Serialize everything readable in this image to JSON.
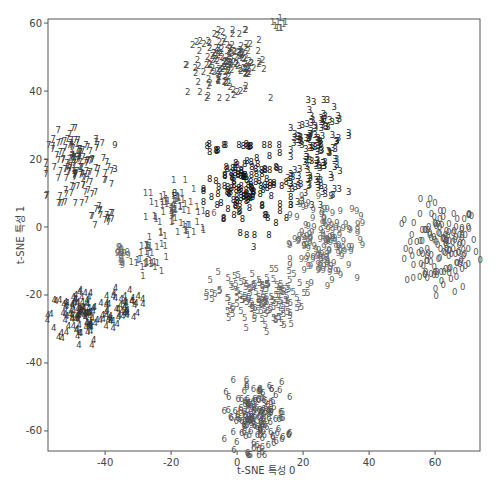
{
  "chart_data": {
    "type": "scatter",
    "title": "",
    "xlabel": "t-SNE 특성 0",
    "ylabel": "t-SNE 특성 1",
    "xlim": [
      -57.3,
      73.6
    ],
    "ylim": [
      -65.9,
      61.2
    ],
    "xticks": [
      -40,
      -20,
      0,
      20,
      40,
      60
    ],
    "yticks": [
      -60,
      -40,
      -20,
      0,
      20,
      40,
      60
    ],
    "grid": false,
    "legend": "none (points drawn as digit glyphs 0-9)",
    "marker": "text glyph of class label",
    "clusters": [
      {
        "label": "0",
        "color": "#555555",
        "n": 150,
        "groups": [
          {
            "cx": 62,
            "cy": -6,
            "sx": 5.5,
            "sy": 6.5
          }
        ]
      },
      {
        "label": "1",
        "color": "#5a5a5a",
        "n": 110,
        "groups": [
          {
            "cx": -19,
            "cy": 6,
            "sx": 4,
            "sy": 3.5,
            "w": 0.55
          },
          {
            "cx": -27,
            "cy": -8,
            "sx": 2.5,
            "sy": 3,
            "w": 0.3
          },
          {
            "cx": 13,
            "cy": 60,
            "sx": 1,
            "sy": 1.5,
            "w": 0.08
          },
          {
            "cx": -14,
            "cy": -1,
            "sx": 2,
            "sy": 1,
            "w": 0.07
          }
        ]
      },
      {
        "label": "2",
        "color": "#4a4a4a",
        "n": 150,
        "groups": [
          {
            "cx": -3,
            "cy": 48,
            "sx": 6,
            "sy": 4.5
          }
        ]
      },
      {
        "label": "3",
        "color": "#222222",
        "n": 150,
        "groups": [
          {
            "cx": 25,
            "cy": 22,
            "sx": 4,
            "sy": 7,
            "w": 0.88
          },
          {
            "cx": 18,
            "cy": 26,
            "sx": 1,
            "sy": 1,
            "w": 0.06
          },
          {
            "cx": 17,
            "cy": 13,
            "sx": 1,
            "sy": 1,
            "w": 0.06
          }
        ]
      },
      {
        "label": "4",
        "color": "#333333",
        "n": 160,
        "groups": [
          {
            "cx": -47,
            "cy": -26,
            "sx": 5,
            "sy": 4,
            "w": 0.75
          },
          {
            "cx": -34,
            "cy": -23,
            "sx": 2.5,
            "sy": 2.5,
            "w": 0.25
          }
        ]
      },
      {
        "label": "5",
        "color": "#666666",
        "n": 150,
        "groups": [
          {
            "cx": 6,
            "cy": -21,
            "sx": 7,
            "sy": 4
          }
        ]
      },
      {
        "label": "6",
        "color": "#555555",
        "n": 160,
        "groups": [
          {
            "cx": 6,
            "cy": -56,
            "sx": 4.5,
            "sy": 5
          }
        ]
      },
      {
        "label": "7",
        "color": "#3a3a3a",
        "n": 150,
        "groups": [
          {
            "cx": -48,
            "cy": 18,
            "sx": 4.5,
            "sy": 5,
            "w": 0.9
          },
          {
            "cx": -43,
            "cy": 4,
            "sx": 1,
            "sy": 1.5,
            "w": 0.05
          },
          {
            "cx": -39,
            "cy": 3,
            "sx": 1,
            "sy": 1,
            "w": 0.05
          }
        ]
      },
      {
        "label": "8",
        "color": "#111111",
        "n": 150,
        "groups": [
          {
            "cx": 3,
            "cy": 11,
            "sx": 6,
            "sy": 6,
            "w": 0.92
          },
          {
            "cx": -8,
            "cy": 23,
            "sx": 1,
            "sy": 1,
            "w": 0.04
          },
          {
            "cx": 3,
            "cy": 24,
            "sx": 1,
            "sy": 0.5,
            "w": 0.04
          }
        ]
      },
      {
        "label": "9",
        "color": "#666666",
        "n": 150,
        "groups": [
          {
            "cx": 27,
            "cy": -4,
            "sx": 5,
            "sy": 6,
            "w": 0.85
          },
          {
            "cx": -35,
            "cy": -8,
            "sx": 1.5,
            "sy": 1.5,
            "w": 0.1
          },
          {
            "cx": 19,
            "cy": -2,
            "sx": 1.5,
            "sy": 2,
            "w": 0.05
          }
        ]
      }
    ],
    "outliers": [
      {
        "label": "2",
        "x": -1,
        "y": 39,
        "color": "#4a4a4a"
      },
      {
        "label": "3",
        "x": -37,
        "y": 17,
        "color": "#222222"
      },
      {
        "label": "3",
        "x": 5,
        "y": -6,
        "color": "#222222"
      },
      {
        "label": "3",
        "x": 19,
        "y": 17,
        "color": "#222222"
      },
      {
        "label": "9",
        "x": -37,
        "y": 24,
        "color": "#333333"
      },
      {
        "label": "6",
        "x": -7,
        "y": 4,
        "color": "#666666"
      },
      {
        "label": "5",
        "x": 9,
        "y": -31,
        "color": "#666666"
      },
      {
        "label": "9",
        "x": 20,
        "y": 6,
        "color": "#666666"
      },
      {
        "label": "6",
        "x": 5,
        "y": -65,
        "color": "#555555"
      },
      {
        "label": "8",
        "x": -19,
        "y": 10,
        "color": "#111111"
      }
    ]
  },
  "plot_area": {
    "left": 48,
    "top": 19,
    "right": 480,
    "bottom": 451
  },
  "colors": {
    "frame": "#555555",
    "text": "#444444",
    "background": "#ffffff"
  }
}
